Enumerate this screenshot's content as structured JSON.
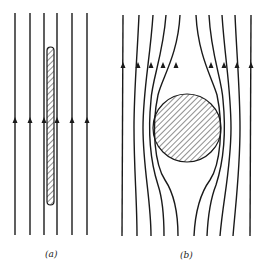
{
  "figure": {
    "panels": [
      {
        "id": "a",
        "label": "(a)",
        "object": "thin hatched rod parallel to field",
        "line_count": 6
      },
      {
        "id": "b",
        "label": "(b)",
        "object": "hatched circular cylinder deflecting field lines",
        "line_count": 10
      }
    ],
    "colors": {
      "line": "#1a1a1a",
      "background": "#ffffff"
    }
  }
}
